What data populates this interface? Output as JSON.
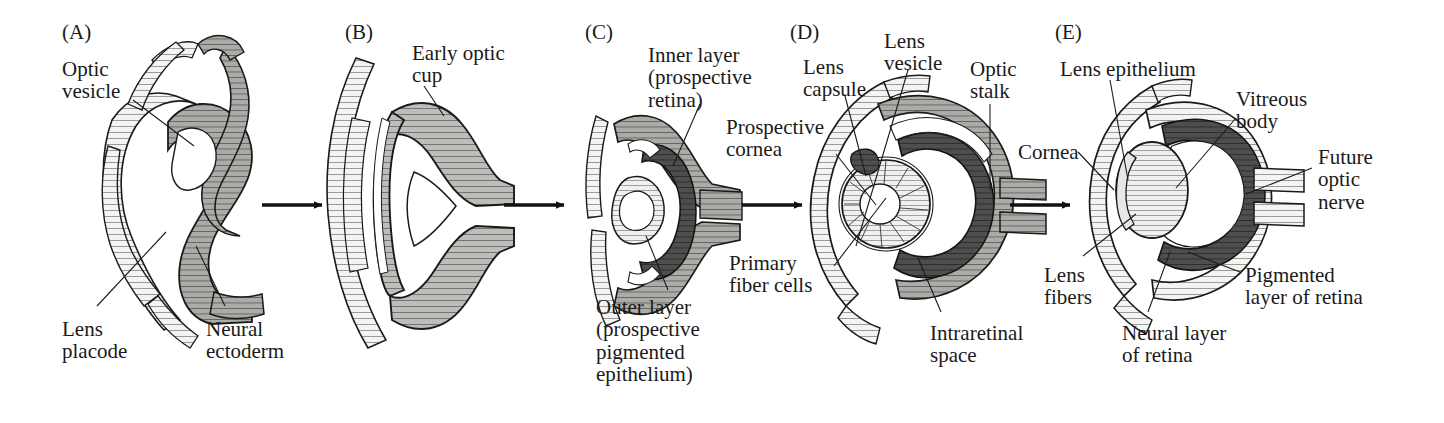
{
  "figure": {
    "background_color": "#ffffff",
    "ink_color": "#1a1a1a",
    "width": 1444,
    "height": 423
  },
  "palette": {
    "light_tissue": "#f2f2f0",
    "mid_tissue": "#b9b9b6",
    "grey_tissue": "#a9a9a6",
    "dark_tissue": "#4a4a48",
    "outline": "#1a1a1a",
    "lumen": "#ffffff"
  },
  "panels": [
    {
      "id": "A",
      "letter": "(A)",
      "letter_x": 62,
      "letter_y": 22,
      "labels": [
        {
          "name": "optic-vesicle",
          "text": "Optic\nvesicle",
          "x": 62,
          "y": 58,
          "align": "left"
        },
        {
          "name": "lens-placode",
          "text": "Lens\nplacode",
          "x": 62,
          "y": 318,
          "align": "left"
        },
        {
          "name": "neural-ectoderm",
          "text": "Neural\nectoderm",
          "x": 206,
          "y": 318,
          "align": "left"
        }
      ]
    },
    {
      "id": "B",
      "letter": "(B)",
      "letter_x": 345,
      "letter_y": 22,
      "labels": [
        {
          "name": "early-optic-cup",
          "text": "Early optic\ncup",
          "x": 412,
          "y": 42,
          "align": "left"
        }
      ]
    },
    {
      "id": "C",
      "letter": "(C)",
      "letter_x": 585,
      "letter_y": 22,
      "labels": [
        {
          "name": "inner-layer-prospective-retina",
          "text": "Inner layer\n(prospective\nretina)",
          "x": 648,
          "y": 44,
          "align": "left"
        },
        {
          "name": "outer-layer-prospective-pigmented-epithelium",
          "text": "Outer layer\n(prospective\npigmented\nepithelium)",
          "x": 596,
          "y": 296,
          "align": "left"
        }
      ]
    },
    {
      "id": "D",
      "letter": "(D)",
      "letter_x": 790,
      "letter_y": 22,
      "labels": [
        {
          "name": "lens-capsule",
          "text": "Lens\ncapsule",
          "x": 803,
          "y": 56,
          "align": "left"
        },
        {
          "name": "lens-vesicle",
          "text": "Lens\nvesicle",
          "x": 884,
          "y": 30,
          "align": "left"
        },
        {
          "name": "optic-stalk",
          "text": "Optic\nstalk",
          "x": 970,
          "y": 58,
          "align": "left"
        },
        {
          "name": "prospective-cornea",
          "text": "Prospective\ncornea",
          "x": 726,
          "y": 116,
          "align": "left"
        },
        {
          "name": "primary-fiber-cells",
          "text": "Primary\nfiber cells",
          "x": 729,
          "y": 252,
          "align": "left"
        },
        {
          "name": "intraretinal-space",
          "text": "Intraretinal\nspace",
          "x": 930,
          "y": 322,
          "align": "left"
        }
      ]
    },
    {
      "id": "E",
      "letter": "(E)",
      "letter_x": 1055,
      "letter_y": 22,
      "labels": [
        {
          "name": "lens-epithelium",
          "text": "Lens epithelium",
          "x": 1060,
          "y": 58,
          "align": "left"
        },
        {
          "name": "vitreous-body",
          "text": "Vitreous\nbody",
          "x": 1236,
          "y": 88,
          "align": "left"
        },
        {
          "name": "cornea",
          "text": "Cornea",
          "x": 1018,
          "y": 141,
          "align": "left"
        },
        {
          "name": "future-optic-nerve",
          "text": "Future\noptic\nnerve",
          "x": 1318,
          "y": 146,
          "align": "left"
        },
        {
          "name": "lens-fibers",
          "text": "Lens\nfibers",
          "x": 1044,
          "y": 264,
          "align": "left"
        },
        {
          "name": "pigmented-layer-of-retina",
          "text": "Pigmented\nlayer of retina",
          "x": 1245,
          "y": 264,
          "align": "left"
        },
        {
          "name": "neural-layer-of-retina",
          "text": "Neural layer\nof retina",
          "x": 1122,
          "y": 322,
          "align": "left"
        }
      ]
    }
  ],
  "arrows": [
    {
      "name": "arrow-a-to-b",
      "x1": 262,
      "y1": 205,
      "x2": 322,
      "y2": 205
    },
    {
      "name": "arrow-b-to-c",
      "x1": 504,
      "y1": 205,
      "x2": 564,
      "y2": 205
    },
    {
      "name": "arrow-c-to-d",
      "x1": 742,
      "y1": 205,
      "x2": 802,
      "y2": 205
    },
    {
      "name": "arrow-d-to-e",
      "x1": 1010,
      "y1": 205,
      "x2": 1070,
      "y2": 205
    }
  ],
  "leaders": [
    {
      "name": "leader-optic-vesicle",
      "points": "133,100 194,146"
    },
    {
      "name": "leader-lens-placode",
      "points": "97,306 166,232"
    },
    {
      "name": "leader-neural-ectoderm",
      "points": "225,306 196,246"
    },
    {
      "name": "leader-early-optic-cup",
      "points": "424,86 444,116"
    },
    {
      "name": "leader-inner-layer",
      "points": "700,104 673,166"
    },
    {
      "name": "leader-outer-layer",
      "points": "668,290 646,236"
    },
    {
      "name": "leader-prospective-cornea",
      "points": "836,154 876,205"
    },
    {
      "name": "leader-lens-capsule",
      "points": "845,96 866,176"
    },
    {
      "name": "leader-lens-vesicle",
      "points": "908,70 856,246"
    },
    {
      "name": "leader-optic-stalk",
      "points": "990,104 990,190"
    },
    {
      "name": "leader-primary-fiber-cells",
      "points": "834,266 886,198"
    },
    {
      "name": "leader-intraretinal-space",
      "points": "941,312 918,258"
    },
    {
      "name": "leader-lens-epithelium",
      "points": "1110,80 1128,180"
    },
    {
      "name": "leader-vitreous-body",
      "points": "1236,118 1176,188"
    },
    {
      "name": "leader-cornea",
      "points": "1078,152 1114,190"
    },
    {
      "name": "leader-future-optic-nerve",
      "points": "1312,168 1246,194"
    },
    {
      "name": "leader-lens-fibers",
      "points": "1083,256 1136,214"
    },
    {
      "name": "leader-pigmented-layer",
      "points": "1240,272 1188,252"
    },
    {
      "name": "leader-neural-layer",
      "points": "1148,312 1170,252"
    }
  ]
}
